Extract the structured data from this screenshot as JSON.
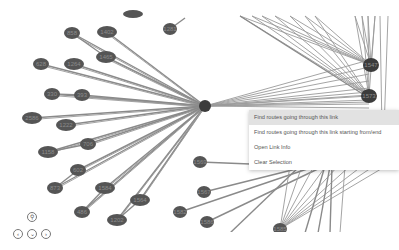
{
  "graph": {
    "hub": {
      "x": 205,
      "y": 106
    },
    "left_nodes": [
      {
        "label": "858",
        "x": 72,
        "y": 33,
        "rx": 8,
        "ry": 6
      },
      {
        "label": "1402",
        "x": 107,
        "y": 32,
        "rx": 10,
        "ry": 6
      },
      {
        "label": "1465",
        "x": 106,
        "y": 57,
        "rx": 10,
        "ry": 6
      },
      {
        "label": "628",
        "x": 41,
        "y": 64,
        "rx": 8,
        "ry": 6
      },
      {
        "label": "1264",
        "x": 74,
        "y": 64,
        "rx": 10,
        "ry": 6
      },
      {
        "label": "330",
        "x": 52,
        "y": 94,
        "rx": 8,
        "ry": 6
      },
      {
        "label": "393",
        "x": 82,
        "y": 95,
        "rx": 8,
        "ry": 6
      },
      {
        "label": "2586",
        "x": 32,
        "y": 118,
        "rx": 10,
        "ry": 6
      },
      {
        "label": "1222",
        "x": 66,
        "y": 125,
        "rx": 10,
        "ry": 6
      },
      {
        "label": "1158",
        "x": 48,
        "y": 152,
        "rx": 10,
        "ry": 6
      },
      {
        "label": "706",
        "x": 88,
        "y": 144,
        "rx": 8,
        "ry": 6
      },
      {
        "label": "602",
        "x": 78,
        "y": 170,
        "rx": 8,
        "ry": 6
      },
      {
        "label": "873",
        "x": 55,
        "y": 188,
        "rx": 8,
        "ry": 6
      },
      {
        "label": "1584",
        "x": 105,
        "y": 188,
        "rx": 10,
        "ry": 6
      },
      {
        "label": "1564",
        "x": 140,
        "y": 200,
        "rx": 10,
        "ry": 6
      },
      {
        "label": "486",
        "x": 82,
        "y": 212,
        "rx": 8,
        "ry": 6
      },
      {
        "label": "1202",
        "x": 117,
        "y": 220,
        "rx": 10,
        "ry": 6
      }
    ],
    "top_nodes": [
      {
        "label": "",
        "x": 133,
        "y": 14,
        "rx": 10,
        "ry": 4
      },
      {
        "label": "1281",
        "x": 170,
        "y": 29,
        "rx": 7,
        "ry": 6
      }
    ],
    "right_nodes": [
      {
        "label": "1547",
        "x": 371,
        "y": 65,
        "rx": 8,
        "ry": 7
      },
      {
        "label": "1573",
        "x": 369,
        "y": 96,
        "rx": 8,
        "ry": 7
      },
      {
        "label": "1569",
        "x": 200,
        "y": 162,
        "rx": 7,
        "ry": 6
      },
      {
        "label": "1567",
        "x": 204,
        "y": 192,
        "rx": 7,
        "ry": 6
      },
      {
        "label": "1582",
        "x": 180,
        "y": 212,
        "rx": 7,
        "ry": 6
      },
      {
        "label": "1586",
        "x": 207,
        "y": 222,
        "rx": 7,
        "ry": 6
      },
      {
        "label": "1585",
        "x": 280,
        "y": 229,
        "rx": 7,
        "ry": 6
      }
    ]
  },
  "context_menu": {
    "items": [
      {
        "label": "Find routes going through this link",
        "active": true
      },
      {
        "label": "Find routes going through this link starting from/end",
        "active": false
      },
      {
        "label": "Open Link Info",
        "active": false
      },
      {
        "label": "Clear Selection",
        "active": false
      }
    ]
  },
  "navigation": {
    "zoom_icon": "magnifier-icon",
    "buttons": [
      "pan-left-icon",
      "pan-down-icon",
      "pan-right-icon"
    ]
  },
  "colors": {
    "node": "#555555",
    "edge": "#8a8a8a",
    "menu_highlight": "#e2e2e2"
  }
}
